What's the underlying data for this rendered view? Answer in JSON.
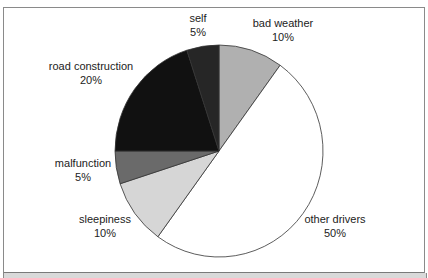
{
  "chart_data": {
    "type": "pie",
    "title": "",
    "start_angle": "12 o'clock",
    "direction": "clockwise",
    "categories": [
      "bad weather",
      "other drivers",
      "sleepiness",
      "malfunction",
      "road construction",
      "self"
    ],
    "values": [
      10,
      50,
      10,
      5,
      20,
      5
    ],
    "value_labels": [
      "10%",
      "50%",
      "10%",
      "5%",
      "20%",
      "5%"
    ],
    "colors": [
      "#b0b0b0",
      "#ffffff",
      "#d6d6d6",
      "#6a6a6a",
      "#111111",
      "#262626"
    ],
    "legend": "none (data labels placed outside slices)"
  },
  "labels": {
    "self": {
      "name": "self",
      "pct": "5%"
    },
    "bad_weather": {
      "name": "bad weather",
      "pct": "10%"
    },
    "road_construction": {
      "name": "road construction",
      "pct": "20%"
    },
    "malfunction": {
      "name": "malfunction",
      "pct": "5%"
    },
    "sleepiness": {
      "name": "sleepiness",
      "pct": "10%"
    },
    "other_drivers": {
      "name": "other drivers",
      "pct": "50%"
    }
  }
}
